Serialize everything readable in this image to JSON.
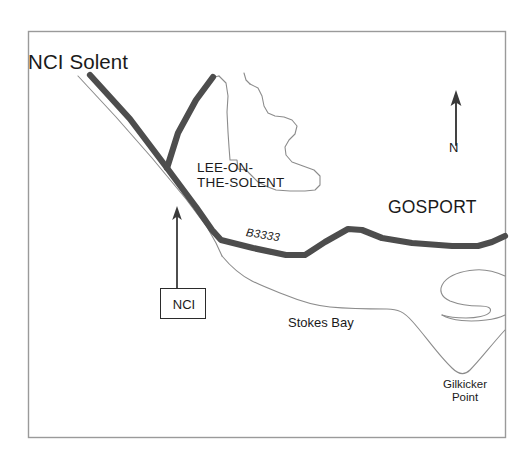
{
  "map": {
    "title": "NCI Solent",
    "frame": {
      "border_color": "#9a9a9a",
      "background_color": "#ffffff",
      "x": 28,
      "y": 31,
      "width": 477,
      "height": 406
    },
    "colors": {
      "road": "#4d4d4d",
      "coastline": "#8c8c8c",
      "text": "#1a1a1a",
      "frame": "#9a9a9a",
      "arrow": "#3a3a3a",
      "box_border": "#2b2b2b"
    },
    "labels": {
      "title": "NCI Solent",
      "town_lee_line1": "LEE-ON-",
      "town_lee_line2": "THE-SOLENT",
      "town_gosport": "GOSPORT",
      "road_number": "B3333",
      "bay": "Stokes Bay",
      "point_line1": "Gilkicker",
      "point_line2": "Point",
      "north": "N",
      "nci_box": "NCI"
    },
    "marker": {
      "box_label": "NCI",
      "box": {
        "x": 160,
        "y": 288,
        "width": 46,
        "height": 31
      },
      "arrow_from": {
        "x": 177,
        "y": 288
      },
      "arrow_to": {
        "x": 177,
        "y": 207
      }
    },
    "compass": {
      "label": "N",
      "arrow_from": {
        "x": 456,
        "y": 144
      },
      "arrow_to": {
        "x": 456,
        "y": 92
      }
    },
    "features": [
      {
        "name": "coast-road-b3333",
        "type": "road",
        "label": "B3333",
        "stroke_width": 6
      },
      {
        "name": "branch-road-north",
        "type": "road",
        "label": "",
        "stroke_width": 6
      },
      {
        "name": "solent-shoreline",
        "type": "coastline",
        "stroke_width": 1
      },
      {
        "name": "lee-on-the-solent-built-up-area",
        "type": "outline",
        "stroke_width": 1
      },
      {
        "name": "stokes-bay-shoreline",
        "type": "coastline",
        "stroke_width": 1
      },
      {
        "name": "gosport-harbour-inlet",
        "type": "coastline",
        "stroke_width": 1
      }
    ]
  }
}
